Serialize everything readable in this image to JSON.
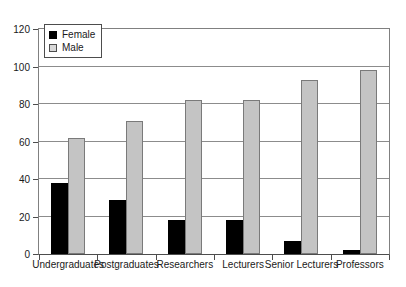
{
  "chart_data": {
    "type": "bar",
    "title": "",
    "subtitle": "",
    "xlabel": "",
    "ylabel": "",
    "categories": [
      "Undergraduates",
      "Postgraduates",
      "Researchers",
      "Lecturers",
      "Senior Lecturers",
      "Professors"
    ],
    "series": [
      {
        "name": "Female",
        "color": "#000000",
        "values": [
          38,
          29,
          18,
          18,
          7,
          2
        ]
      },
      {
        "name": "Male",
        "color": "#c4c4c4",
        "values": [
          62,
          71,
          82,
          82,
          93,
          98
        ]
      }
    ],
    "ylim": [
      0,
      120
    ],
    "yticks": [
      0,
      20,
      40,
      60,
      80,
      100,
      120
    ],
    "ytick_labels": [
      "0",
      "20",
      "40",
      "60",
      "80",
      "100",
      "120"
    ],
    "grid": "horizontal",
    "legend_position": "top-left",
    "legend_entries": [
      "Female",
      "Male"
    ]
  }
}
